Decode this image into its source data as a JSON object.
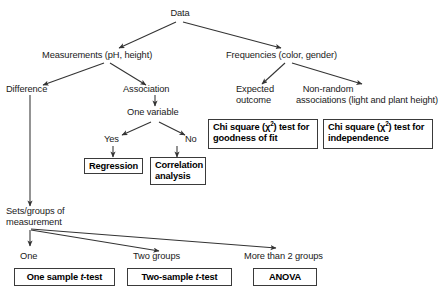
{
  "diagram": {
    "colors": {
      "background": "#ffffff",
      "text": "#1a1a1a",
      "arrow": "#333333",
      "box_border": "#3a3a3a"
    },
    "root": {
      "label": "Data"
    },
    "level1": [
      {
        "label": "Measurements (pH, height)"
      },
      {
        "label": "Frequencies (color, gender)"
      }
    ],
    "level2": [
      {
        "label": "Difference"
      },
      {
        "label": "Association"
      },
      {
        "label_line1": "Expected",
        "label_line2": "outcome"
      },
      {
        "label_line1": "Non-random",
        "label_line2": "associations (light and plant height)"
      }
    ],
    "association": {
      "question": "One variable",
      "yes": "Yes",
      "no": "No"
    },
    "outcome_boxes": {
      "regression": "Regression",
      "correlation_line1": "Correlation",
      "correlation_line2": "analysis",
      "chi_goodness_prefix": "Chi square (χ",
      "chi_goodness_sup": "2",
      "chi_goodness_mid": ") test for",
      "chi_goodness_line2": "goodness of fit",
      "chi_independence_prefix": "Chi square (χ",
      "chi_independence_sup": "2",
      "chi_independence_mid": ") test for",
      "chi_independence_line2": "independence"
    },
    "difference_branch": {
      "node_line1": "Sets/groups of",
      "node_line2": "measurement",
      "groups": [
        {
          "label": "One",
          "test_pre": "One sample ",
          "test_ital": "t",
          "test_post": "-test"
        },
        {
          "label": "Two groups",
          "test_pre": "Two-sample ",
          "test_ital": "t",
          "test_post": "-test"
        },
        {
          "label": "More than 2 groups",
          "test_pre": "ANOVA",
          "test_ital": "",
          "test_post": ""
        }
      ]
    }
  }
}
